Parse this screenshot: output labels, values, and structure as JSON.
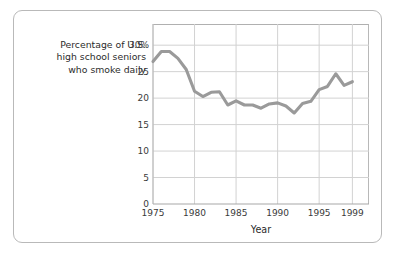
{
  "figure": {
    "y_axis_caption_lines": [
      "Percentage of U.S.",
      "high school seniors",
      "who smoke daily"
    ],
    "x_axis_title": "Year"
  },
  "colors": {
    "line": "#9a9a9a",
    "grid": "#d2d2d2",
    "axis": "#b0b0b0",
    "card_border": "#b9b9b9",
    "text": "#2b2b2b",
    "background": "#ffffff"
  },
  "chart_data": {
    "type": "line",
    "title": "",
    "subtitle": "",
    "xlabel": "Year",
    "ylabel": "Percentage of U.S. high school seniors who smoke daily",
    "xlim": [
      1975,
      2001
    ],
    "ylim": [
      0,
      34
    ],
    "grid": true,
    "legend": "none",
    "y_ticks": [
      0,
      5,
      10,
      15,
      20,
      25,
      30
    ],
    "y_tick_labels": [
      "0",
      "5",
      "10",
      "15",
      "20",
      "25",
      "30%"
    ],
    "x_ticks": [
      1975,
      1980,
      1985,
      1990,
      1995,
      1999
    ],
    "x_tick_labels": [
      "1975",
      "1980",
      "1985",
      "1990",
      "1995",
      "1999"
    ],
    "series": [
      {
        "name": "Percentage of U.S. high school seniors who smoke daily",
        "x": [
          1975,
          1976,
          1977,
          1978,
          1979,
          1980,
          1981,
          1982,
          1983,
          1984,
          1985,
          1986,
          1987,
          1988,
          1989,
          1990,
          1991,
          1992,
          1993,
          1994,
          1995,
          1996,
          1997,
          1998,
          1999
        ],
        "values": [
          26.9,
          28.8,
          28.8,
          27.5,
          25.4,
          21.3,
          20.3,
          21.1,
          21.2,
          18.7,
          19.5,
          18.7,
          18.7,
          18.1,
          18.9,
          19.1,
          18.5,
          17.2,
          19.0,
          19.4,
          21.6,
          22.2,
          24.6,
          22.4,
          23.1
        ]
      }
    ]
  }
}
